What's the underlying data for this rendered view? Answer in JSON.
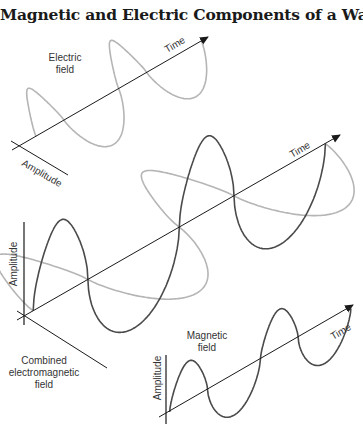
{
  "title": "Magnetic and Electric Components of a Wave",
  "colors": {
    "electric_wave": "#b5b5b5",
    "magnetic_wave": "#4a4a4a",
    "axis": "#1a1a1a",
    "text": "#333333"
  },
  "panels": {
    "electric": {
      "label_line1": "Electric",
      "label_line2": "field",
      "time_axis_label": "Time",
      "amplitude_axis_label": "Amplitude"
    },
    "combined": {
      "time_axis_label": "Time",
      "amplitude_axis_label": "Amplitude",
      "label_line1": "Combined",
      "label_line2": "electromagnetic",
      "label_line3": "field"
    },
    "magnetic": {
      "label_line1": "Magnetic",
      "label_line2": "field",
      "time_axis_label": "Time",
      "amplitude_axis_label": "Amplitude"
    }
  },
  "wave": {
    "cycles_shown": 2
  }
}
